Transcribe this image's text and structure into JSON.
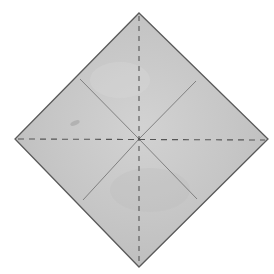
{
  "diagram": {
    "paper": {
      "shape": "square rotated 45 degrees (diamond)",
      "fill_color": "#c9c9c9",
      "edge_color": "#5a5a5a"
    },
    "folds": [
      {
        "id": "vertical-diagonal",
        "kind": "valley-fold",
        "style": "dashed",
        "from": "top-corner",
        "to": "bottom-corner"
      },
      {
        "id": "horizontal-diagonal",
        "kind": "valley-fold",
        "style": "dashed",
        "from": "left-corner",
        "to": "right-corner"
      }
    ],
    "creases": [
      {
        "id": "crease-upper-left",
        "style": "solid",
        "from": "center",
        "to": "upper-left-edge-midpoint"
      },
      {
        "id": "crease-upper-right",
        "style": "solid",
        "from": "center",
        "to": "upper-right-edge-midpoint"
      },
      {
        "id": "crease-lower-left",
        "style": "solid",
        "from": "center",
        "to": "lower-left-edge-midpoint"
      },
      {
        "id": "crease-lower-right",
        "style": "solid",
        "from": "center",
        "to": "lower-right-edge-midpoint"
      }
    ],
    "colors": {
      "fold_line": "#555555",
      "crease_line": "#777777",
      "smudge": "#a8a8a8"
    }
  }
}
